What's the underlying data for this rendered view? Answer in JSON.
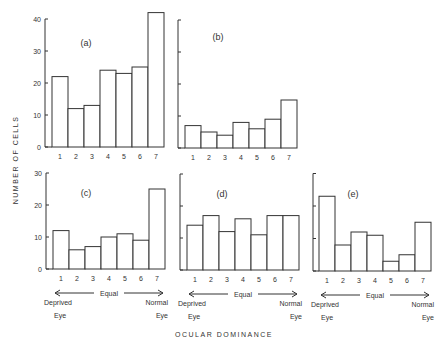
{
  "figure": {
    "ylabel": "NUMBER OF CELLS",
    "xlabel": "OCULAR DOMINANCE",
    "annotations": {
      "equal": "Equal",
      "deprived_top": "Deprived",
      "deprived_bottom": "Eye",
      "normal_top": "Normal",
      "normal_bottom": "Eye"
    }
  },
  "chart_data": [
    {
      "type": "bar",
      "title": "(a)",
      "categories": [
        "1",
        "2",
        "3",
        "4",
        "5",
        "6",
        "7"
      ],
      "values": [
        22,
        12,
        13,
        24,
        23,
        25,
        42
      ],
      "ylabel": "NUMBER OF CELLS",
      "xlabel": "OCULAR DOMINANCE",
      "ylim": [
        0,
        40
      ],
      "yticks": [
        0,
        10,
        20,
        30,
        40
      ],
      "ytick_labels_shown": true,
      "grid": false
    },
    {
      "type": "bar",
      "title": "(b)",
      "categories": [
        "1",
        "2",
        "3",
        "4",
        "5",
        "6",
        "7"
      ],
      "values": [
        7,
        5,
        4,
        8,
        6,
        9,
        15
      ],
      "ylim": [
        0,
        40
      ],
      "yticks": [
        0,
        10,
        20,
        30,
        40
      ],
      "ytick_labels_shown": false,
      "grid": false
    },
    {
      "type": "bar",
      "title": "(c)",
      "categories": [
        "1",
        "2",
        "3",
        "4",
        "5",
        "6",
        "7"
      ],
      "values": [
        12,
        6,
        7,
        10,
        11,
        9,
        25
      ],
      "ylim": [
        0,
        30
      ],
      "yticks": [
        0,
        10,
        20,
        30
      ],
      "ytick_labels_shown": true,
      "x_annotation": [
        "Deprived Eye",
        "Equal",
        "Normal Eye"
      ],
      "grid": false
    },
    {
      "type": "bar",
      "title": "(d)",
      "categories": [
        "1",
        "2",
        "3",
        "4",
        "5",
        "6",
        "7"
      ],
      "values": [
        14,
        17,
        12,
        16,
        11,
        17,
        17
      ],
      "ylim": [
        0,
        30
      ],
      "yticks": [
        0,
        10,
        20,
        30
      ],
      "ytick_labels_shown": false,
      "x_annotation": [
        "Deprived Eye",
        "Equal",
        "Normal Eye"
      ],
      "grid": false
    },
    {
      "type": "bar",
      "title": "(e)",
      "categories": [
        "1",
        "2",
        "3",
        "4",
        "5",
        "6",
        "7"
      ],
      "values": [
        23,
        8,
        12,
        11,
        3,
        5,
        15
      ],
      "ylim": [
        0,
        30
      ],
      "yticks": [
        0,
        10,
        20,
        30
      ],
      "ytick_labels_shown": false,
      "x_annotation": [
        "Deprived Eye",
        "Equal",
        "Normal Eye"
      ],
      "grid": false
    }
  ],
  "layout": {
    "panels": [
      {
        "axis_x": 45,
        "bar_x0": 52,
        "bar_w": 16,
        "base_y": 147,
        "px_per_unit": 3.2,
        "label_x": 86,
        "label_y": 46,
        "tick_labels": true,
        "annot": false
      },
      {
        "axis_x": 178,
        "bar_x0": 185,
        "bar_w": 16,
        "base_y": 148,
        "px_per_unit": 3.2,
        "label_x": 218,
        "label_y": 40,
        "tick_labels": false,
        "annot": false
      },
      {
        "axis_x": 46,
        "bar_x0": 53,
        "bar_w": 16,
        "base_y": 269,
        "px_per_unit": 3.2,
        "label_x": 86,
        "label_y": 196,
        "tick_labels": true,
        "annot": true
      },
      {
        "axis_x": 180,
        "bar_x0": 187,
        "bar_w": 16,
        "base_y": 270,
        "px_per_unit": 3.2,
        "label_x": 222,
        "label_y": 197,
        "tick_labels": false,
        "annot": true
      },
      {
        "axis_x": 313,
        "bar_x0": 319,
        "bar_w": 16,
        "base_y": 271,
        "px_per_unit": 3.25,
        "label_x": 353,
        "label_y": 197,
        "tick_labels": false,
        "annot": true
      }
    ]
  }
}
